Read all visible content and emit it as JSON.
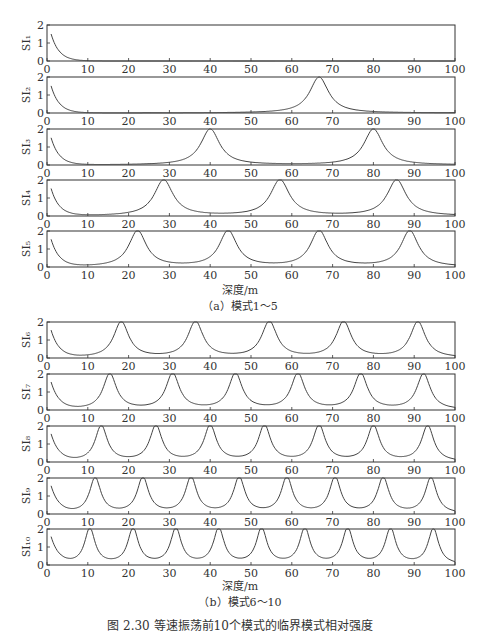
{
  "figure": {
    "caption": "图 2.30  等速振荡前10个模式的临界模式相对强度",
    "subfigures": [
      {
        "label": "（a）模式1～5",
        "xlabel": "深度/m"
      },
      {
        "label": "（b）模式6～10",
        "xlabel": "深度/m"
      }
    ]
  },
  "chart_data": [
    {
      "type": "line",
      "title": "（a）模式1～5",
      "xlabel": "深度/m",
      "xlim": [
        0,
        100
      ],
      "xticks": [
        0,
        10,
        20,
        30,
        40,
        50,
        60,
        70,
        80,
        90,
        100
      ],
      "ylim": [
        0,
        2
      ],
      "yticks": [
        0,
        1,
        2
      ],
      "grid": false,
      "series": [
        {
          "name": "SI1",
          "ylabel": "SI₁",
          "peaks_x": [],
          "start_value": 1.5
        },
        {
          "name": "SI2",
          "ylabel": "SI₂",
          "peaks_x": [
            66.7
          ],
          "start_value": 1.5
        },
        {
          "name": "SI3",
          "ylabel": "SI₃",
          "peaks_x": [
            40,
            80
          ],
          "start_value": 1.5
        },
        {
          "name": "SI4",
          "ylabel": "SI₄",
          "peaks_x": [
            28.6,
            57.1,
            85.7
          ],
          "start_value": 1.5
        },
        {
          "name": "SI5",
          "ylabel": "SI₅",
          "peaks_x": [
            22.2,
            44.4,
            66.7,
            88.9
          ],
          "start_value": 1.5
        }
      ],
      "peak_value": 2
    },
    {
      "type": "line",
      "title": "（b）模式6～10",
      "xlabel": "深度/m",
      "xlim": [
        0,
        100
      ],
      "xticks": [
        0,
        10,
        20,
        30,
        40,
        50,
        60,
        70,
        80,
        90,
        100
      ],
      "ylim": [
        0,
        2
      ],
      "yticks": [
        0,
        1,
        2
      ],
      "grid": false,
      "series": [
        {
          "name": "SI6",
          "ylabel": "SI₆",
          "peaks_x": [
            18.2,
            36.4,
            54.5,
            72.7,
            90.9
          ],
          "start_value": 1.5
        },
        {
          "name": "SI7",
          "ylabel": "SI₇",
          "peaks_x": [
            15.4,
            30.8,
            46.2,
            61.5,
            76.9,
            92.3
          ],
          "start_value": 1.5
        },
        {
          "name": "SI8",
          "ylabel": "SI₈",
          "peaks_x": [
            13.3,
            26.7,
            40,
            53.3,
            66.7,
            80,
            93.3
          ],
          "start_value": 1.5
        },
        {
          "name": "SI9",
          "ylabel": "SI₉",
          "peaks_x": [
            11.8,
            23.5,
            35.3,
            47.1,
            58.8,
            70.6,
            82.4,
            94.1
          ],
          "start_value": 1.5
        },
        {
          "name": "SI10",
          "ylabel": "SI₁₀",
          "peaks_x": [
            10.5,
            21.1,
            31.6,
            42.1,
            52.6,
            63.2,
            73.7,
            84.2,
            94.7
          ],
          "start_value": 1.5
        }
      ],
      "peak_value": 2
    }
  ],
  "layout": {
    "x_left": 47,
    "x_right": 455,
    "panel_height": 36,
    "panel_tops": [
      [
        25,
        77,
        129,
        180,
        231
      ],
      [
        322,
        374,
        426,
        478,
        529
      ]
    ]
  }
}
